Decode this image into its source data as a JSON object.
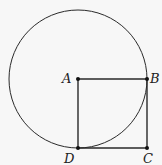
{
  "diagram": {
    "points": [
      {
        "id": "A",
        "label": "A",
        "x": 78,
        "y": 79
      },
      {
        "id": "B",
        "label": "B",
        "x": 147,
        "y": 79
      },
      {
        "id": "C",
        "label": "C",
        "x": 147,
        "y": 148
      },
      {
        "id": "D",
        "label": "D",
        "x": 78,
        "y": 148
      }
    ],
    "circle": {
      "center": "A",
      "radius": 69
    },
    "segments": [
      [
        "A",
        "B"
      ],
      [
        "B",
        "C"
      ],
      [
        "C",
        "D"
      ],
      [
        "D",
        "A"
      ]
    ],
    "colors": {
      "stroke": "#2a2a2a",
      "background": "#f7f7f7"
    }
  }
}
